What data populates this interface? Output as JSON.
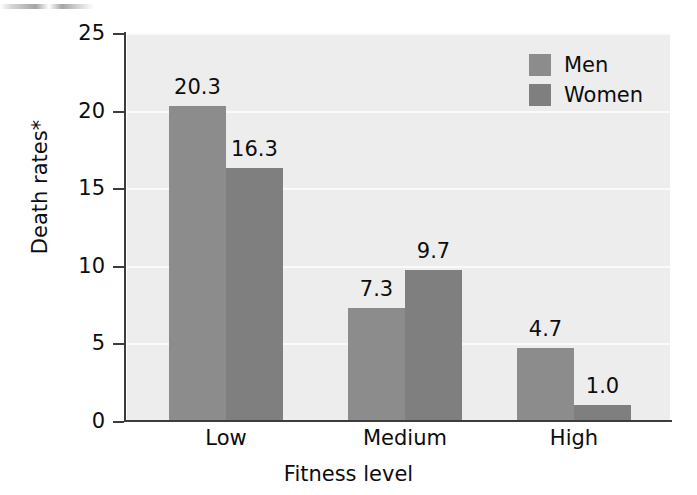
{
  "chart_data": {
    "type": "bar",
    "title": "",
    "categories": [
      "Low",
      "Medium",
      "High"
    ],
    "series": [
      {
        "name": "Men",
        "values": [
          20.3,
          7.3,
          4.7
        ],
        "color": "#8c8c8c"
      },
      {
        "name": "Women",
        "values": [
          16.3,
          9.7,
          1.0
        ],
        "color": "#7f7f7f"
      }
    ],
    "xlabel": "Fitness level",
    "ylabel": "Death rates*",
    "ylim": [
      0,
      25
    ],
    "yticks": [
      0,
      5,
      10,
      15,
      20,
      25
    ],
    "ytick_labels": [
      "0",
      "5",
      "10",
      "15",
      "20",
      "25"
    ],
    "data_labels": [
      "20.3",
      "16.3",
      "7.3",
      "9.7",
      "4.7",
      "1.0"
    ],
    "grid": true,
    "grid_orientation": "horizontal",
    "legend_position": "top-right",
    "legend_entries": [
      "Men",
      "Women"
    ],
    "plot_background": "#ededed",
    "axis_color": "#3c3c3c",
    "footnote_marker": "*"
  },
  "axes": {
    "y": {
      "title": "Death rates*",
      "ticks": [
        {
          "label": "25",
          "value": 25
        },
        {
          "label": "20",
          "value": 20
        },
        {
          "label": "15",
          "value": 15
        },
        {
          "label": "10",
          "value": 10
        },
        {
          "label": "5",
          "value": 5
        },
        {
          "label": "0",
          "value": 0
        }
      ]
    },
    "x": {
      "title": "Fitness level",
      "ticks": [
        {
          "label": "Low"
        },
        {
          "label": "Medium"
        },
        {
          "label": "High"
        }
      ]
    }
  },
  "legend": {
    "items": [
      {
        "label": "Men",
        "color": "#8c8c8c"
      },
      {
        "label": "Women",
        "color": "#7f7f7f"
      }
    ]
  },
  "bars": [
    {
      "group": "Low",
      "series": "Men",
      "value": 20.3,
      "label": "20.3"
    },
    {
      "group": "Low",
      "series": "Women",
      "value": 16.3,
      "label": "16.3"
    },
    {
      "group": "Medium",
      "series": "Men",
      "value": 7.3,
      "label": "7.3"
    },
    {
      "group": "Medium",
      "series": "Women",
      "value": 9.7,
      "label": "9.7"
    },
    {
      "group": "High",
      "series": "Men",
      "value": 4.7,
      "label": "4.7"
    },
    {
      "group": "High",
      "series": "Women",
      "value": 1.0,
      "label": "1.0"
    }
  ]
}
